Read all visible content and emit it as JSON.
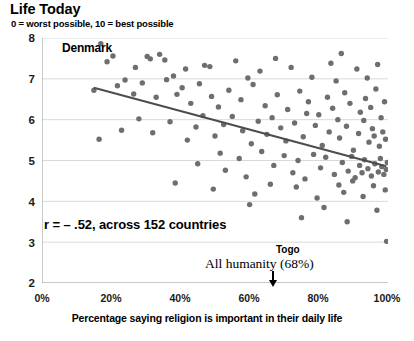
{
  "chart_data": {
    "type": "scatter",
    "title": "Life Today",
    "subtitle": "0 = worst possible, 10 = best possible",
    "xlabel": "Percentage saying religion is important in their daily life",
    "ylabel": "",
    "xlim": [
      0,
      100
    ],
    "ylim": [
      2,
      8
    ],
    "xticks": [
      "0%",
      "20%",
      "40%",
      "60%",
      "80%",
      "100%"
    ],
    "xtick_values": [
      0,
      20,
      40,
      60,
      80,
      100
    ],
    "yticks": [
      "2",
      "3",
      "4",
      "5",
      "6",
      "7",
      "8"
    ],
    "ytick_values": [
      2,
      3,
      4,
      5,
      6,
      7,
      8
    ],
    "grid": "horizontal",
    "legend": "none",
    "marker_color": "#6e6e6e",
    "trendline_color": "#4d4d4d",
    "axis_color": "#a6a6a6",
    "grid_color": "#d9d9d9",
    "annotations": [
      {
        "name": "denmark-label",
        "text": "Denmark",
        "x": 17,
        "y": 7.85
      },
      {
        "name": "correlation-label",
        "text": "r = – .52, across 152 countries",
        "x": 8,
        "y": 3.45
      },
      {
        "name": "togo-label",
        "text": "Togo",
        "x": 82,
        "y": 3.05
      },
      {
        "name": "all-humanity-label",
        "text": "All humanity (68%)",
        "x": 60,
        "y": 2.75
      }
    ],
    "trendline": {
      "x0": 15,
      "y0": 6.78,
      "x1": 99.5,
      "y1": 4.86
    },
    "arrow_marker": {
      "name": "all-humanity-arrow",
      "x": 68,
      "label": "All humanity (68%)"
    },
    "points": [
      [
        17.0,
        7.86
      ],
      [
        20.5,
        7.56
      ],
      [
        18.8,
        7.42
      ],
      [
        27.0,
        7.28
      ],
      [
        30.4,
        7.55
      ],
      [
        31.3,
        7.49
      ],
      [
        34.0,
        7.6
      ],
      [
        35.5,
        7.46
      ],
      [
        38.0,
        7.07
      ],
      [
        41.5,
        7.24
      ],
      [
        47.0,
        7.33
      ],
      [
        48.5,
        7.3
      ],
      [
        56.0,
        7.44
      ],
      [
        59.5,
        7.02
      ],
      [
        63.0,
        7.19
      ],
      [
        67.5,
        7.5
      ],
      [
        72.0,
        7.28
      ],
      [
        78.0,
        7.04
      ],
      [
        83.5,
        7.38
      ],
      [
        85.0,
        6.95
      ],
      [
        86.5,
        7.62
      ],
      [
        91.0,
        7.24
      ],
      [
        94.0,
        7.02
      ],
      [
        97.0,
        7.35
      ],
      [
        15.0,
        6.72
      ],
      [
        21.8,
        6.83
      ],
      [
        24.0,
        6.97
      ],
      [
        26.5,
        6.63
      ],
      [
        29.0,
        6.9
      ],
      [
        33.0,
        6.55
      ],
      [
        36.0,
        6.98
      ],
      [
        39.0,
        6.62
      ],
      [
        40.5,
        6.78
      ],
      [
        43.0,
        6.4
      ],
      [
        45.5,
        6.88
      ],
      [
        49.0,
        6.57
      ],
      [
        51.0,
        6.31
      ],
      [
        54.0,
        6.72
      ],
      [
        57.5,
        6.49
      ],
      [
        61.0,
        6.86
      ],
      [
        64.5,
        6.34
      ],
      [
        68.0,
        6.61
      ],
      [
        71.0,
        6.25
      ],
      [
        74.5,
        6.7
      ],
      [
        77.0,
        6.44
      ],
      [
        80.0,
        6.12
      ],
      [
        82.5,
        6.55
      ],
      [
        84.0,
        6.28
      ],
      [
        87.5,
        6.66
      ],
      [
        89.0,
        6.4
      ],
      [
        92.0,
        6.18
      ],
      [
        93.5,
        6.52
      ],
      [
        95.0,
        6.3
      ],
      [
        96.5,
        6.75
      ],
      [
        98.0,
        6.05
      ],
      [
        99.0,
        6.44
      ],
      [
        16.5,
        5.52
      ],
      [
        23.0,
        5.74
      ],
      [
        28.0,
        6.02
      ],
      [
        32.0,
        5.68
      ],
      [
        37.0,
        5.95
      ],
      [
        42.0,
        5.5
      ],
      [
        44.5,
        5.82
      ],
      [
        46.5,
        6.1
      ],
      [
        50.0,
        5.6
      ],
      [
        52.5,
        5.88
      ],
      [
        55.0,
        6.08
      ],
      [
        58.0,
        5.73
      ],
      [
        60.5,
        5.41
      ],
      [
        62.5,
        5.96
      ],
      [
        65.0,
        5.64
      ],
      [
        66.5,
        6.05
      ],
      [
        69.0,
        5.8
      ],
      [
        70.5,
        5.48
      ],
      [
        73.0,
        5.92
      ],
      [
        75.5,
        5.58
      ],
      [
        76.5,
        6.15
      ],
      [
        79.0,
        5.86
      ],
      [
        81.0,
        5.37
      ],
      [
        83.0,
        5.7
      ],
      [
        85.5,
        6.0
      ],
      [
        86.0,
        5.55
      ],
      [
        88.0,
        5.84
      ],
      [
        90.0,
        5.25
      ],
      [
        91.5,
        5.66
      ],
      [
        93.0,
        5.98
      ],
      [
        94.5,
        5.45
      ],
      [
        95.5,
        5.78
      ],
      [
        96.0,
        5.6
      ],
      [
        97.5,
        5.35
      ],
      [
        98.5,
        5.7
      ],
      [
        99.3,
        5.52
      ],
      [
        45.0,
        4.92
      ],
      [
        51.5,
        5.18
      ],
      [
        53.0,
        4.76
      ],
      [
        57.0,
        5.05
      ],
      [
        59.0,
        4.6
      ],
      [
        63.5,
        5.22
      ],
      [
        67.0,
        4.88
      ],
      [
        70.0,
        5.12
      ],
      [
        72.5,
        4.7
      ],
      [
        74.0,
        5.0
      ],
      [
        76.0,
        4.55
      ],
      [
        78.5,
        5.15
      ],
      [
        80.5,
        4.82
      ],
      [
        82.0,
        5.08
      ],
      [
        84.5,
        4.66
      ],
      [
        86.8,
        4.95
      ],
      [
        88.5,
        4.74
      ],
      [
        89.5,
        5.1
      ],
      [
        90.5,
        4.58
      ],
      [
        91.8,
        4.88
      ],
      [
        92.5,
        4.7
      ],
      [
        93.2,
        5.02
      ],
      [
        94.2,
        4.8
      ],
      [
        95.2,
        4.62
      ],
      [
        96.2,
        4.92
      ],
      [
        97.2,
        4.72
      ],
      [
        97.8,
        5.05
      ],
      [
        98.2,
        4.85
      ],
      [
        98.8,
        4.66
      ],
      [
        99.5,
        4.78
      ],
      [
        99.8,
        4.95
      ],
      [
        38.5,
        4.45
      ],
      [
        49.5,
        4.3
      ],
      [
        61.5,
        4.18
      ],
      [
        66.0,
        4.42
      ],
      [
        73.5,
        4.35
      ],
      [
        79.5,
        4.08
      ],
      [
        85.8,
        4.4
      ],
      [
        87.2,
        4.22
      ],
      [
        89.8,
        4.5
      ],
      [
        92.8,
        4.12
      ],
      [
        95.8,
        4.38
      ],
      [
        99.2,
        4.28
      ],
      [
        60.0,
        3.92
      ],
      [
        75.0,
        3.6
      ],
      [
        81.5,
        3.85
      ],
      [
        88.2,
        3.5
      ],
      [
        96.8,
        3.78
      ],
      [
        99.6,
        3.02
      ]
    ]
  }
}
